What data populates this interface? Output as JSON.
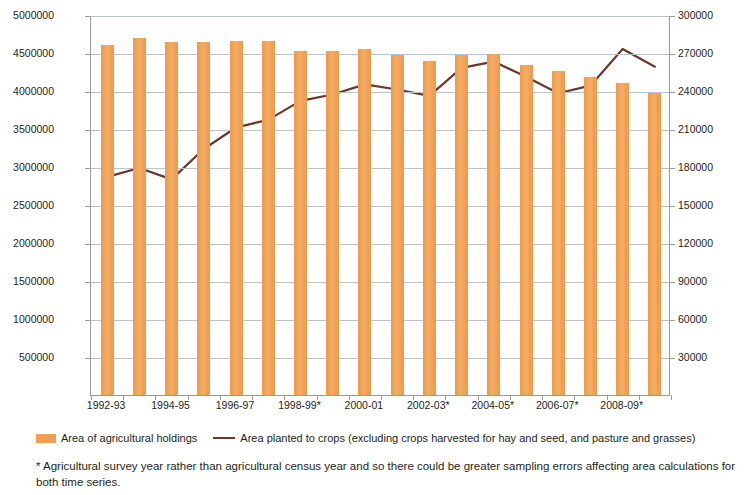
{
  "chart_data": {
    "type": "bar",
    "title": "",
    "subtitle": "",
    "xlabel": "",
    "ylabel": "Area of agricultural holdings (sq km)",
    "y2label": "Area planted to crops (sq km)",
    "grid": true,
    "legend_position": "bottom",
    "categories": [
      "1992-93",
      "1993-94",
      "1994-95",
      "1995-96",
      "1996-97",
      "1997-98",
      "1998-99*",
      "1999-00",
      "2000-01",
      "2001-02",
      "2002-03*",
      "2003-04",
      "2004-05*",
      "2005-06",
      "2006-07*",
      "2007-08",
      "2008-09*",
      "2009-10"
    ],
    "x_tick_labels": [
      "1992-93",
      "",
      "1994-95",
      "",
      "1996-97",
      "",
      "1998-99*",
      "",
      "2000-01",
      "",
      "2002-03*",
      "",
      "2004-05*",
      "",
      "2006-07*",
      "",
      "2008-09*",
      ""
    ],
    "ylim": [
      0,
      5000000
    ],
    "y_ticks": [
      500000,
      1000000,
      1500000,
      2000000,
      2500000,
      3000000,
      3500000,
      4000000,
      4500000,
      5000000
    ],
    "y_tick_labels": [
      "500000",
      "1000000",
      "1500000",
      "2000000",
      "2500000",
      "3000000",
      "3500000",
      "4000000",
      "4500000",
      "5000000"
    ],
    "y2lim": [
      0,
      300000
    ],
    "y2_ticks": [
      30000,
      60000,
      90000,
      120000,
      150000,
      180000,
      210000,
      240000,
      270000,
      300000
    ],
    "y2_tick_labels": [
      "30000",
      "60000",
      "90000",
      "120000",
      "150000",
      "180000",
      "210000",
      "240000",
      "270000",
      "300000"
    ],
    "series": [
      {
        "name": "Area of agricultural holdings",
        "type": "bar",
        "axis": "left",
        "color": "#f0a055",
        "values": [
          4610000,
          4700000,
          4650000,
          4650000,
          4660000,
          4655000,
          4530000,
          4530000,
          4550000,
          4470000,
          4390000,
          4480000,
          4490000,
          4340000,
          4260000,
          4180000,
          4110000,
          3980000
        ]
      },
      {
        "name": "Area planted to crops (excluding crops harvested for hay and seed, and pasture and grasses)",
        "type": "line",
        "axis": "right",
        "color": "#6b372b",
        "values": [
          173000,
          180000,
          171000,
          195000,
          212000,
          218000,
          233000,
          238000,
          246000,
          242000,
          237000,
          259000,
          264000,
          252000,
          239000,
          245000,
          274000,
          260000
        ]
      }
    ]
  },
  "legend": {
    "bar_label": "Area of agricultural holdings",
    "line_label": "Area planted to crops (excluding crops harvested for hay and seed, and pasture and grasses)"
  },
  "footnote": {
    "text": "* Agricultural survey year rather than agricultural census year and so there could be greater sampling errors affecting area calculations for both time series."
  }
}
